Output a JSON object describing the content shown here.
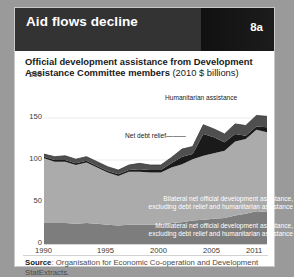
{
  "header": {
    "title": "Aid flows decline",
    "badge": "8a"
  },
  "subtitle": {
    "bold_part": "Official development assistance from Development Assistance Committee members",
    "unit_part": " (2010 $ billions)"
  },
  "source": {
    "label": "Source",
    "text": ": Organisation for Economic Co-operation and Development StatExtracts."
  },
  "annotations": {
    "humanitarian": "Humanitarian assistance",
    "debt_relief": "Net debt relief",
    "bilateral_line1": "Bilateral net official development assistance,",
    "bilateral_line2": "excluding debt relief and humanitarian assistance",
    "multilateral_line1": "Multilateral net official development assistance,",
    "multilateral_line2": "excluding debt relief and humanitarian assistance"
  },
  "colors": {
    "multilateral": "#7d7d7d",
    "bilateral": "#ababab",
    "debt_relief": "#1a1a1a",
    "humanitarian": "#4f4f4f",
    "grid": "#e2e2e2",
    "header_bg": "#333333",
    "page_bg": "#9a9a9a"
  },
  "chart_data": {
    "type": "area",
    "stacked": true,
    "title": "Official development assistance from Development Assistance Committee members (2010 $ billions)",
    "xlabel": "",
    "ylabel": "2010 $ billions",
    "xlim": [
      1990,
      2011
    ],
    "ylim": [
      0,
      200
    ],
    "yticks": [
      0,
      50,
      100,
      150,
      200
    ],
    "xticks": [
      1990,
      1995,
      2000,
      2005,
      2011
    ],
    "grid": true,
    "legend": "in-plot annotations",
    "x": [
      1990,
      1991,
      1992,
      1993,
      1994,
      1995,
      1996,
      1997,
      1998,
      1999,
      2000,
      2001,
      2002,
      2003,
      2004,
      2005,
      2006,
      2007,
      2008,
      2009,
      2010,
      2011
    ],
    "series": [
      {
        "name": "Multilateral net official development assistance, excluding debt relief and humanitarian assistance",
        "values": [
          25,
          25,
          25,
          24,
          25,
          24,
          23,
          22,
          23,
          23,
          23,
          23,
          25,
          26,
          28,
          29,
          30,
          31,
          34,
          36,
          39,
          38
        ]
      },
      {
        "name": "Bilateral net official development assistance, excluding debt relief and humanitarian assistance",
        "values": [
          77,
          73,
          73,
          70,
          72,
          67,
          62,
          59,
          63,
          63,
          62,
          62,
          66,
          69,
          73,
          76,
          78,
          80,
          88,
          89,
          97,
          95
        ]
      },
      {
        "name": "Net debt relief",
        "values": [
          2,
          2,
          2,
          2,
          2,
          2,
          2,
          2,
          2,
          3,
          3,
          3,
          5,
          9,
          6,
          26,
          19,
          10,
          9,
          4,
          4,
          6
        ]
      },
      {
        "name": "Humanitarian assistance",
        "values": [
          3,
          4,
          5,
          5,
          5,
          5,
          5,
          5,
          6,
          7,
          6,
          6,
          7,
          9,
          9,
          11,
          10,
          10,
          12,
          12,
          13,
          13
        ]
      }
    ],
    "totals": [
      107,
      104,
      105,
      101,
      104,
      98,
      92,
      88,
      94,
      96,
      94,
      94,
      103,
      113,
      116,
      142,
      137,
      131,
      143,
      141,
      153,
      152
    ],
    "notable": {
      "peak_year": 2005,
      "peak_value": 142,
      "trough_year": 1997,
      "trough_value": 88,
      "final_year": 2011,
      "final_value": 152
    }
  }
}
